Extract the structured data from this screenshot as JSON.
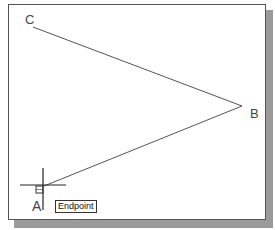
{
  "canvas": {
    "points": [
      {
        "name": "A",
        "x": 40,
        "y": 188
      },
      {
        "name": "B",
        "x": 242,
        "y": 106
      },
      {
        "name": "C",
        "x": 33,
        "y": 27
      }
    ],
    "labels": {
      "a": "A",
      "b": "B",
      "c": "C"
    },
    "line_color": "#555555"
  },
  "tooltip": {
    "text": "Endpoint"
  },
  "cursor": {
    "type": "crosshair",
    "x": 43,
    "y": 185
  }
}
